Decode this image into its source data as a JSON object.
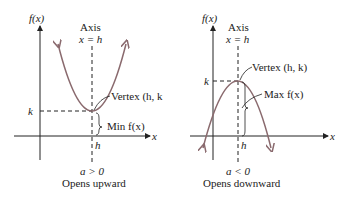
{
  "left_graph": {
    "y_label": "f(x)",
    "x_label": "x",
    "axis_title": "Axis",
    "axis_eq": "x = h",
    "vertex_label": "Vertex (h, k",
    "k_label": "k",
    "h_label": "h",
    "min_label": "Min f(x)",
    "condition": "a > 0",
    "caption": "Opens upward"
  },
  "right_graph": {
    "y_label": "f(x)",
    "x_label": "x",
    "axis_title": "Axis",
    "axis_eq": "x = h",
    "vertex_label": "Vertex (h, k)",
    "k_label": "k",
    "h_label": "h",
    "max_label": "Max f(x)",
    "condition": "a < 0",
    "caption": "Opens downward"
  },
  "colors": {
    "curve": "#8a6a6e",
    "ink": "#222222"
  }
}
